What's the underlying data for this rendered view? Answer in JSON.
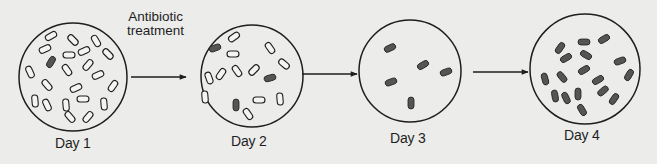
{
  "diagram": {
    "title": "",
    "annotation": {
      "line1": "Antibiotic",
      "line2": "treatment"
    },
    "colors": {
      "background": "#ececea",
      "stroke": "#1e1e1e",
      "resistant_fill": "#555555",
      "susceptible_fill": "#f4f4f2"
    },
    "stages": [
      {
        "label": "Day 1",
        "circle": {
          "cx": 73,
          "cy": 77,
          "r": 54
        },
        "bacteria": [
          {
            "x": 51,
            "y": 36,
            "a": -30,
            "res": false
          },
          {
            "x": 73,
            "y": 40,
            "a": 45,
            "res": false
          },
          {
            "x": 96,
            "y": 41,
            "a": 60,
            "res": false
          },
          {
            "x": 45,
            "y": 49,
            "a": -25,
            "res": false
          },
          {
            "x": 69,
            "y": 55,
            "a": 0,
            "res": false
          },
          {
            "x": 84,
            "y": 51,
            "a": -25,
            "res": false
          },
          {
            "x": 108,
            "y": 54,
            "a": 45,
            "res": false
          },
          {
            "x": 51,
            "y": 62,
            "a": -60,
            "res": true
          },
          {
            "x": 67,
            "y": 70,
            "a": 55,
            "res": false
          },
          {
            "x": 88,
            "y": 65,
            "a": -50,
            "res": false
          },
          {
            "x": 30,
            "y": 72,
            "a": 65,
            "res": false
          },
          {
            "x": 98,
            "y": 75,
            "a": -25,
            "res": false
          },
          {
            "x": 47,
            "y": 85,
            "a": 50,
            "res": false
          },
          {
            "x": 76,
            "y": 88,
            "a": -25,
            "res": false
          },
          {
            "x": 113,
            "y": 86,
            "a": -55,
            "res": false
          },
          {
            "x": 35,
            "y": 101,
            "a": 85,
            "res": false
          },
          {
            "x": 47,
            "y": 105,
            "a": 65,
            "res": false
          },
          {
            "x": 66,
            "y": 105,
            "a": 85,
            "res": false
          },
          {
            "x": 83,
            "y": 99,
            "a": 0,
            "res": false
          },
          {
            "x": 104,
            "y": 104,
            "a": 85,
            "res": false
          },
          {
            "x": 70,
            "y": 117,
            "a": 50,
            "res": false
          },
          {
            "x": 88,
            "y": 117,
            "a": -50,
            "res": false
          }
        ]
      },
      {
        "label": "Day 2",
        "circle": {
          "cx": 252,
          "cy": 76,
          "r": 51
        },
        "bacteria": [
          {
            "x": 234,
            "y": 37,
            "a": -35,
            "res": false
          },
          {
            "x": 215,
            "y": 48,
            "a": -20,
            "res": true
          },
          {
            "x": 233,
            "y": 54,
            "a": 0,
            "res": false
          },
          {
            "x": 270,
            "y": 48,
            "a": 55,
            "res": false
          },
          {
            "x": 284,
            "y": 64,
            "a": 40,
            "res": false
          },
          {
            "x": 237,
            "y": 71,
            "a": 55,
            "res": false
          },
          {
            "x": 254,
            "y": 70,
            "a": -45,
            "res": false
          },
          {
            "x": 221,
            "y": 74,
            "a": -55,
            "res": false
          },
          {
            "x": 209,
            "y": 78,
            "a": 70,
            "res": false
          },
          {
            "x": 270,
            "y": 78,
            "a": -15,
            "res": true
          },
          {
            "x": 205,
            "y": 97,
            "a": 85,
            "res": false
          },
          {
            "x": 236,
            "y": 105,
            "a": 90,
            "res": true
          },
          {
            "x": 259,
            "y": 100,
            "a": 0,
            "res": false
          },
          {
            "x": 280,
            "y": 99,
            "a": 85,
            "res": false
          },
          {
            "x": 248,
            "y": 114,
            "a": 55,
            "res": false
          }
        ]
      },
      {
        "label": "Day 3",
        "circle": {
          "cx": 410,
          "cy": 71,
          "r": 51
        },
        "bacteria": [
          {
            "x": 390,
            "y": 48,
            "a": -25,
            "res": true
          },
          {
            "x": 423,
            "y": 65,
            "a": -30,
            "res": true
          },
          {
            "x": 446,
            "y": 72,
            "a": -20,
            "res": true
          },
          {
            "x": 391,
            "y": 82,
            "a": -20,
            "res": true
          },
          {
            "x": 411,
            "y": 103,
            "a": 90,
            "res": true
          }
        ]
      },
      {
        "label": "Day 4",
        "circle": {
          "cx": 585,
          "cy": 69,
          "r": 55
        },
        "bacteria": [
          {
            "x": 584,
            "y": 42,
            "a": 0,
            "res": true
          },
          {
            "x": 604,
            "y": 39,
            "a": -30,
            "res": true
          },
          {
            "x": 560,
            "y": 48,
            "a": -55,
            "res": true
          },
          {
            "x": 566,
            "y": 58,
            "a": -30,
            "res": true
          },
          {
            "x": 586,
            "y": 55,
            "a": 30,
            "res": true
          },
          {
            "x": 620,
            "y": 61,
            "a": -20,
            "res": true
          },
          {
            "x": 584,
            "y": 70,
            "a": -30,
            "res": true
          },
          {
            "x": 629,
            "y": 75,
            "a": -60,
            "res": true
          },
          {
            "x": 545,
            "y": 79,
            "a": 75,
            "res": true
          },
          {
            "x": 562,
            "y": 77,
            "a": 50,
            "res": true
          },
          {
            "x": 598,
            "y": 80,
            "a": -30,
            "res": true
          },
          {
            "x": 603,
            "y": 91,
            "a": -40,
            "res": true
          },
          {
            "x": 555,
            "y": 96,
            "a": 80,
            "res": true
          },
          {
            "x": 566,
            "y": 98,
            "a": 65,
            "res": true
          },
          {
            "x": 578,
            "y": 94,
            "a": 90,
            "res": true
          },
          {
            "x": 614,
            "y": 99,
            "a": -55,
            "res": true
          },
          {
            "x": 582,
            "y": 110,
            "a": 60,
            "res": true
          }
        ]
      }
    ],
    "arrows": [
      {
        "x1": 131,
        "x2": 186,
        "y": 77
      },
      {
        "x1": 302,
        "x2": 357,
        "y": 74
      },
      {
        "x1": 473,
        "x2": 528,
        "y": 72
      }
    ],
    "legend": {
      "resistant": "dark filled rods",
      "susceptible": "open outlined rods"
    }
  }
}
